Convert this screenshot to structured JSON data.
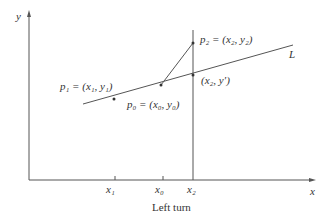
{
  "diagram": {
    "caption": "Left turn",
    "axes": {
      "x_label": "x",
      "y_label": "y"
    },
    "line_label": "L",
    "points": {
      "p1": "p₁ = (x₁, y₁)",
      "p0": "p₀ = (x₀, y₀)",
      "p2": "p₂ = (x₂, y₂)",
      "proj": "(x₂, y′)"
    },
    "ticks": [
      "x₁",
      "x₀",
      "x₂"
    ],
    "colors": {
      "stroke": "#555555",
      "text": "#333333"
    }
  }
}
